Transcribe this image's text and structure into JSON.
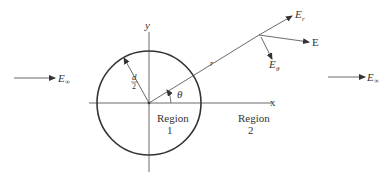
{
  "diagram": {
    "colors": {
      "ink": "#333333",
      "background": "#ffffff"
    },
    "axes": {
      "x_label": "x",
      "y_label": "y"
    },
    "circle": {
      "radius_label_num": "d",
      "radius_label_den": "2"
    },
    "angle_label": "θ",
    "radial_label": "r",
    "regions": [
      {
        "line1": "Region",
        "line2": "1"
      },
      {
        "line1": "Region",
        "line2": "2"
      }
    ],
    "field_vectors": {
      "e_r": {
        "main": "E",
        "sub": "r"
      },
      "e_total": {
        "main": "E"
      },
      "e_theta": {
        "main": "E",
        "sub": "θ"
      }
    },
    "incident_field_left": {
      "main": "E",
      "sub": "∞"
    },
    "incident_field_right": {
      "main": "E",
      "sub": "∞"
    }
  }
}
